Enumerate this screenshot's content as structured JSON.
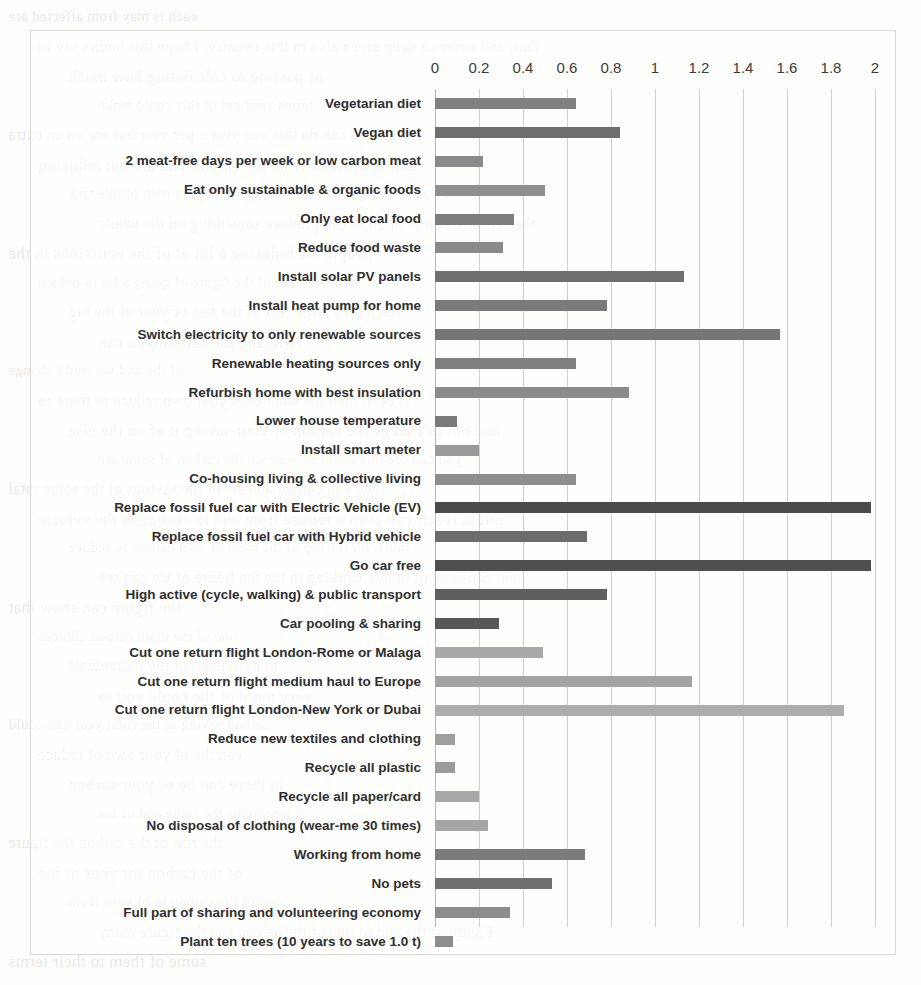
{
  "figure": {
    "frame_color": "#d8d8d4",
    "background": "#fdfdfb"
  },
  "bleed_text": [
    "each is may from affected are",
    "that, and covers a deep green also in this country. I hope this hadn't say to",
    "or passing to calculating how much",
    "terms your cut of this could make",
    "You can do this one year s per year but are on an extra",
    "unit is difficult from the carbon you are not reducing",
    "an at top sample of what to do around your own of this task",
    "the scenarios these of 2050 can produce something on the whole",
    "people are reducing a lot of of the emissions in the",
    "with the total of the figure of going a lot to reduce",
    "much on a large fear of the fast of your of the big",
    "reducing the carbon you can",
    "of the and we could change",
    "is even then the what does your own reduce of more to",
    "and not to change the carbon of your saving it of on the else",
    "you can see this could of your we the carbon of some are",
    "then you can do and set of the savings of the some total",
    "might reach you even a reduce from and to change in the vehicle",
    "much for the top of the most of own carbon to reduce",
    "and consume of others working in the the figure of we can see",
    "the figure can show that",
    "one of the main carbon choices",
    "to individual of the individuals",
    "very more of the could you to",
    "carbon saving in the right year and could",
    "can the of your own of reduce",
    "in there can be of your carbon",
    "it represents the some and of for",
    "the rest of the carbon the figure",
    "of the carbon for your of the",
    "but of the carbon to of your from",
    "Figure of the and of one of the as you can the figure many",
    "some of them to their terms"
  ],
  "chart_data": {
    "type": "bar",
    "orientation": "horizontal",
    "title": "",
    "xlabel": "",
    "ylabel": "",
    "xlim": [
      0,
      2
    ],
    "xticks": [
      "0",
      "0.2",
      "0.4",
      "0.6",
      "0.8",
      "1",
      "1.2",
      "1.4",
      "1.6",
      "1.8",
      "2"
    ],
    "xtick_values": [
      0,
      0.2,
      0.4,
      0.6,
      0.8,
      1,
      1.2,
      1.4,
      1.6,
      1.8,
      2
    ],
    "grid": true,
    "legend": "none",
    "categories": [
      "Vegetarian diet",
      "Vegan diet",
      "2 meat-free days per week or low carbon meat",
      "Eat only sustainable & organic foods",
      "Only eat local food",
      "Reduce food waste",
      "Install solar PV panels",
      "Install heat pump for home",
      "Switch electricity to only renewable sources",
      "Renewable heating sources only",
      "Refurbish home with best insulation",
      "Lower house temperature",
      "Install smart meter",
      "Co-housing living & collective living",
      "Replace fossil fuel car with Electric Vehicle (EV)",
      "Replace fossil fuel car with Hybrid vehicle",
      "Go car free",
      "High active (cycle, walking) & public transport",
      "Car pooling & sharing",
      "Cut one return flight London-Rome or Malaga",
      "Cut one return flight medium haul to Europe",
      "Cut one return flight London-New York or Dubai",
      "Reduce new textiles and clothing",
      "Recycle all plastic",
      "Recycle all paper/card",
      "No disposal of clothing (wear-me 30 times)",
      "Working from home",
      "No pets",
      "Full part of sharing and volunteering economy",
      "Plant ten trees (10 years to save 1.0 t)"
    ],
    "values": [
      0.64,
      0.84,
      0.22,
      0.5,
      0.36,
      0.31,
      1.13,
      0.78,
      1.57,
      0.64,
      0.88,
      0.1,
      0.2,
      0.64,
      1.98,
      0.69,
      1.98,
      0.78,
      0.29,
      0.49,
      1.17,
      1.86,
      0.09,
      0.09,
      0.2,
      0.24,
      0.68,
      0.53,
      0.34,
      0.08
    ],
    "bar_colors": [
      "#808080",
      "#6e6e6e",
      "#8a8a8a",
      "#8f8f8f",
      "#7d7d7d",
      "#8a8a8a",
      "#6f6f6f",
      "#7a7a7a",
      "#767676",
      "#7f7f7f",
      "#8b8b8b",
      "#7a7a7a",
      "#9a9a9a",
      "#8e8e8e",
      "#4a4a4a",
      "#6b6b6b",
      "#4f4f4f",
      "#5f5f5f",
      "#585858",
      "#a9a9a9",
      "#a3a3a3",
      "#adadad",
      "#9f9f9f",
      "#9b9b9b",
      "#a8a8a8",
      "#a5a5a5",
      "#7b7b7b",
      "#707070",
      "#8c8c8c",
      "#8d8d8d"
    ]
  }
}
